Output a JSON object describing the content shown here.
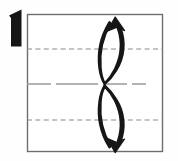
{
  "figure": {
    "kind": "origami-fold-step",
    "step_number": "1",
    "background_color": "#fefefe",
    "ink_color": "#161616"
  },
  "paper": {
    "label": "square-sheet",
    "outline_color": "#6e6e6e",
    "fill_color": "#ffffff",
    "x": 27,
    "y": 14,
    "width": 136,
    "height": 138
  },
  "fold_lines": [
    {
      "name": "upper-valley-fold-line",
      "style": "dashed",
      "color": "#8a8a8a",
      "y": 49,
      "x1": 27,
      "x2": 163
    },
    {
      "name": "center-mountain-reference-line",
      "style": "dash-dot-long",
      "color": "#9a9a9a",
      "y": 84,
      "x1": 27,
      "x2": 163
    },
    {
      "name": "lower-valley-fold-line",
      "style": "dashed",
      "color": "#8a8a8a",
      "y": 120,
      "x1": 27,
      "x2": 163
    }
  ],
  "arrows": [
    {
      "name": "upper-fold-arrow",
      "direction": "up",
      "description": "curved double-stroke fold arrow from center line up to top edge",
      "color": "#161616",
      "head_x": 118,
      "head_y": 20,
      "tail_x": 104,
      "tail_y": 83
    },
    {
      "name": "lower-fold-arrow",
      "direction": "down",
      "description": "curved double-stroke fold arrow from center line down to bottom edge",
      "color": "#161616",
      "head_x": 118,
      "head_y": 148,
      "tail_x": 104,
      "tail_y": 86
    }
  ]
}
